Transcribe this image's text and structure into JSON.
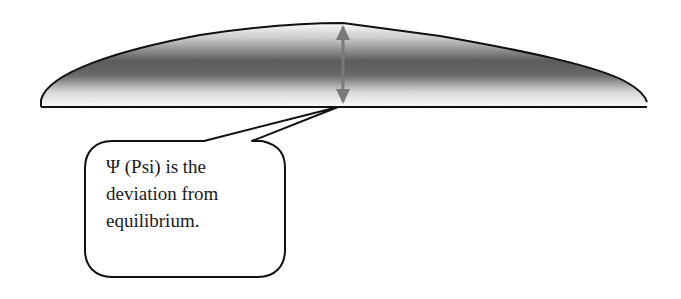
{
  "diagram": {
    "type": "wave-deviation-illustration",
    "elements": {
      "wave_shape": {
        "description": "asymmetric wave hump above equilibrium baseline, shaded gray gradient"
      },
      "baseline": {
        "description": "equilibrium line"
      },
      "arrow": {
        "description": "double-headed vertical arrow indicating amplitude"
      },
      "callout": {
        "lines": [
          "Ψ (Psi) is the",
          "deviation from",
          "equilibrium."
        ]
      }
    },
    "colors": {
      "outline": "#111111",
      "shade_dark": "#555555",
      "shade_light": "#ffffff",
      "arrow": "#7a7a7a",
      "background": "#ffffff"
    }
  }
}
